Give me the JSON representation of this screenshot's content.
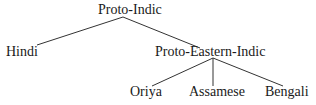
{
  "diagram": {
    "type": "tree",
    "root": {
      "label": "Proto-Indic",
      "children": [
        {
          "label": "Hindi"
        },
        {
          "label": "Proto-Eastern-Indic",
          "children": [
            {
              "label": "Oriya"
            },
            {
              "label": "Assamese"
            },
            {
              "label": "Bengali"
            }
          ]
        }
      ]
    }
  },
  "nodes": {
    "proto_indic": "Proto-Indic",
    "hindi": "Hindi",
    "proto_eastern_indic": "Proto-Eastern-Indic",
    "oriya": "Oriya",
    "assamese": "Assamese",
    "bengali": "Bengali"
  },
  "colors": {
    "line": "#333333",
    "text": "#1a1a1a",
    "background": "#ffffff"
  }
}
